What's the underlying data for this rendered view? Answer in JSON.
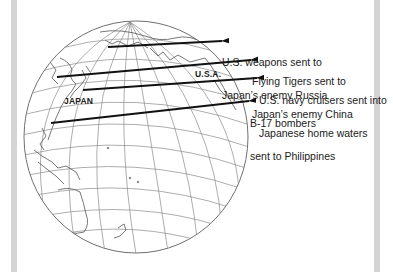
{
  "figure": {
    "map_labels": {
      "japan": "JAPAN",
      "usa": "U.S.A."
    },
    "annotations": [
      {
        "line1": "U.S. weapons sent to",
        "line2": "Japan’s enemy Russia"
      },
      {
        "line1": "Flying Tigers sent to",
        "line2": "Japan’s enemy China"
      },
      {
        "line1": "U.S. navy cruisers sent into",
        "line2": "Japanese home waters"
      },
      {
        "line1": "B-17 bombers",
        "line2": "sent to Philippines"
      }
    ],
    "colors": {
      "frame": "#d4d4d4",
      "gridlines": "#8a8a8a",
      "arrows": "#111111"
    }
  }
}
